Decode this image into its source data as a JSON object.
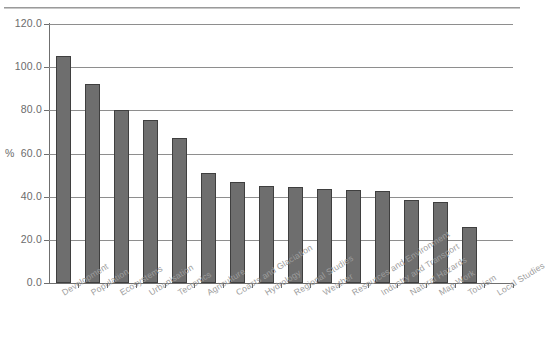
{
  "chart_data": {
    "type": "bar",
    "title": "",
    "xlabel": "",
    "ylabel": "%",
    "ylim": [
      0,
      120
    ],
    "ytick_labels": [
      "120.0",
      "100.0",
      "80.0",
      "60.0",
      "40.0",
      "20.0",
      "0.0"
    ],
    "ytick_values": [
      120,
      100,
      80,
      60,
      40,
      20,
      0
    ],
    "grid": true,
    "legend": "none",
    "bar_color": "#6e6e6e",
    "bar_edge_color": "#3f3f3f",
    "categories": [
      "Development",
      "Population",
      "Ecosystems",
      "Urbanisation",
      "Tectonics",
      "Agriculture",
      "Coasts and Glaciation",
      "Hydrology",
      "Regional Studies",
      "Weather",
      "Resources and Environment",
      "Industry and Transport",
      "Natural Hazards",
      "Map Work",
      "Tourism",
      "Local Studies"
    ],
    "values": [
      105,
      92,
      80,
      75.5,
      67,
      51,
      47,
      45,
      44.5,
      43.5,
      43,
      42.5,
      38.5,
      37.5,
      26,
      0
    ]
  },
  "axis": {
    "y_title": "%"
  },
  "clipped_header": ""
}
